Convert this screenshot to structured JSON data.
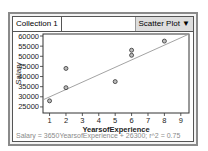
{
  "caption": "below the graph:",
  "window": {
    "collection_label": "Collection 1",
    "plot_type_select": "Scatter Plot ▼"
  },
  "chart_data": {
    "type": "scatter",
    "title": "",
    "xlabel": "YearsofExperience",
    "ylabel": "Salary",
    "xlim": [
      0.6,
      9.5
    ],
    "ylim": [
      22000,
      61000
    ],
    "x_ticks": [
      1,
      2,
      3,
      4,
      5,
      6,
      7,
      8,
      9
    ],
    "y_ticks": [
      25000,
      30000,
      35000,
      40000,
      45000,
      50000,
      55000,
      60000
    ],
    "grid": false,
    "points": [
      {
        "x": 1,
        "y": 28000
      },
      {
        "x": 2,
        "y": 44000
      },
      {
        "x": 2,
        "y": 34500
      },
      {
        "x": 5,
        "y": 37500
      },
      {
        "x": 6,
        "y": 53000
      },
      {
        "x": 6,
        "y": 50500
      },
      {
        "x": 8,
        "y": 57500
      }
    ],
    "trendline": {
      "slope": 3650,
      "intercept": 26300,
      "r2": 0.75
    },
    "equation_label": "Salary = 3650YearsofExperience + 26300; r^2 = 0.75"
  }
}
